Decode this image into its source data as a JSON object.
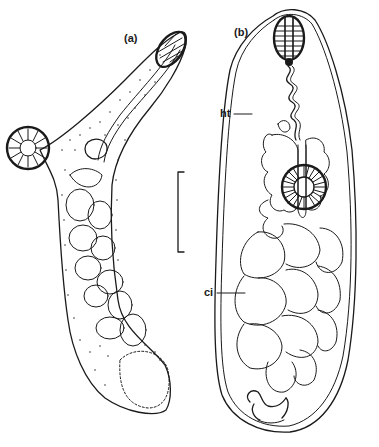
{
  "figure": {
    "panels": [
      {
        "id": "a",
        "label": "(a)"
      },
      {
        "id": "b",
        "label": "(b)"
      }
    ],
    "annotations": [
      {
        "id": "ht",
        "text": "ht"
      },
      {
        "id": "ci",
        "text": "ci"
      }
    ],
    "scale_bar": {
      "orientation": "vertical",
      "length_px": 80
    }
  },
  "colors": {
    "ink": "#1a1a1a",
    "background": "#ffffff"
  }
}
